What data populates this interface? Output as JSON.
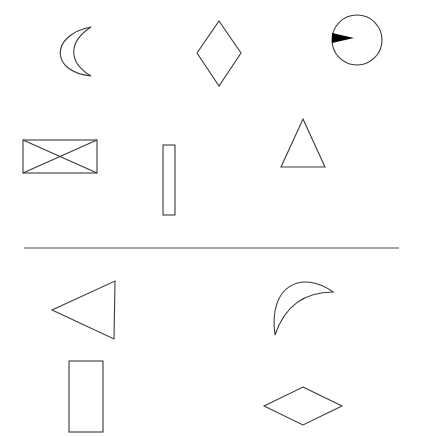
{
  "diagram": {
    "type": "shape-matching-puzzle",
    "background": "#ffffff",
    "stroke_color": "#3a3a3a",
    "top_panel": {
      "shapes": [
        {
          "id": "crescent-left",
          "name": "crescent",
          "orientation": "opening-right"
        },
        {
          "id": "diamond-tall",
          "name": "diamond",
          "orientation": "vertical"
        },
        {
          "id": "circle-with-pointer",
          "name": "circle",
          "detail": "black wedge pointing inward from left edge"
        },
        {
          "id": "rect-crossed",
          "name": "rectangle-with-x",
          "orientation": "horizontal"
        },
        {
          "id": "rect-thin",
          "name": "rectangle",
          "orientation": "vertical-thin"
        },
        {
          "id": "triangle-up",
          "name": "triangle",
          "orientation": "pointing-up"
        }
      ]
    },
    "separator": {
      "name": "horizontal-divider"
    },
    "bottom_panel": {
      "shapes": [
        {
          "id": "triangle-left",
          "name": "triangle",
          "orientation": "pointing-left"
        },
        {
          "id": "crescent-rotated",
          "name": "crescent",
          "orientation": "opening-lower-right"
        },
        {
          "id": "rect-tall",
          "name": "rectangle",
          "orientation": "vertical"
        },
        {
          "id": "diamond-wide",
          "name": "diamond",
          "orientation": "horizontal"
        }
      ]
    }
  }
}
